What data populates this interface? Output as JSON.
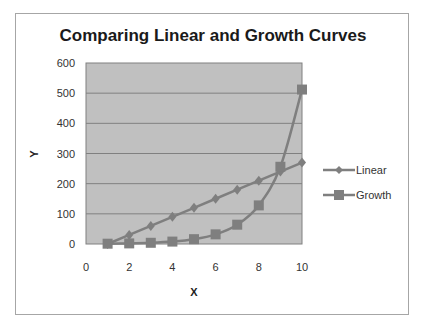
{
  "chart_data": {
    "type": "line",
    "title": "Comparing Linear and Growth Curves",
    "xlabel": "X",
    "ylabel": "Y",
    "x": [
      1,
      2,
      3,
      4,
      5,
      6,
      7,
      8,
      9,
      10
    ],
    "series": [
      {
        "name": "Linear",
        "marker": "diamond",
        "values": [
          0,
          30,
          60,
          90,
          120,
          150,
          180,
          210,
          240,
          270
        ]
      },
      {
        "name": "Growth",
        "marker": "square",
        "values": [
          1,
          2,
          4,
          8,
          16,
          32,
          64,
          128,
          256,
          512
        ]
      }
    ],
    "xlim": [
      0,
      10
    ],
    "ylim": [
      0,
      600
    ],
    "x_ticks": [
      "0",
      "2",
      "4",
      "6",
      "8",
      "10"
    ],
    "y_ticks": [
      "0",
      "100",
      "200",
      "300",
      "400",
      "500",
      "600"
    ],
    "grid": "horizontal major gridlines",
    "legend_position": "right",
    "colors": {
      "plot_bg": "#c0c0c0",
      "series": "#7f7f7f",
      "gridline": "#808080"
    }
  }
}
